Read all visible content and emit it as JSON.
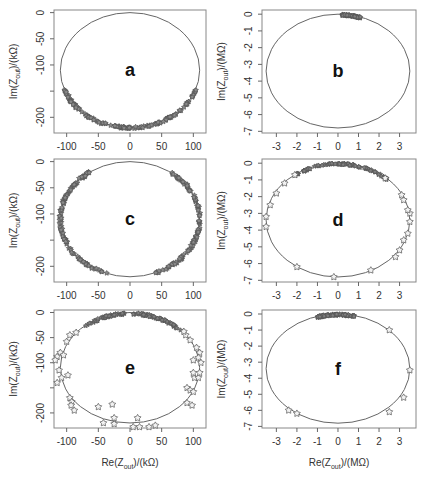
{
  "figure": {
    "caption_hint": "",
    "x_axis_label_k": "Re(Z_out)/(kΩ)",
    "x_axis_label_M": "Re(Z_out)/(MΩ)",
    "y_axis_label_k": "Im(Z_out)/(kΩ)",
    "y_axis_label_M": "Im(Z_out)/(MΩ)"
  },
  "chart_data": [
    {
      "panel": "a",
      "type": "scatter",
      "units": "kΩ",
      "xlabel": "Re(Z_out)/(kΩ)",
      "ylabel": "Im(Z_out)/(kΩ)",
      "xlim": [
        -120,
        120
      ],
      "ylim": [
        -230,
        5
      ],
      "xticks": [
        -100,
        -50,
        0,
        50,
        100
      ],
      "yticks": [
        0,
        -50,
        -100,
        -150,
        -200
      ],
      "yticklabels": [
        "0",
        "-50",
        "-100",
        "",
        "-200"
      ],
      "circle": {
        "cx": 0,
        "cy": -110,
        "rx": 110,
        "ry": 110
      },
      "points_arc_deg": [
        200,
        340
      ],
      "density": "dense"
    },
    {
      "panel": "b",
      "type": "scatter",
      "units": "MΩ",
      "xlabel": "Re(Z_out)/(MΩ)",
      "ylabel": "Im(Z_out)/(MΩ)",
      "xlim": [
        -3.7,
        3.8
      ],
      "ylim": [
        -7.1,
        0.25
      ],
      "xticks": [
        -3,
        -2,
        -1,
        0,
        1,
        2,
        3
      ],
      "yticks": [
        0,
        -1,
        -2,
        -3,
        -4,
        -5,
        -6,
        -7
      ],
      "circle": {
        "cx": 0,
        "cy": -3.4,
        "rx": 3.5,
        "ry": 3.4
      },
      "points_x_range": [
        0.2,
        1.1
      ],
      "density": "dense"
    },
    {
      "panel": "c",
      "type": "scatter",
      "units": "kΩ",
      "xlabel": "Re(Z_out)/(kΩ)",
      "ylabel": "Im(Z_out)/(kΩ)",
      "xlim": [
        -120,
        120
      ],
      "ylim": [
        -230,
        5
      ],
      "xticks": [
        -100,
        -50,
        0,
        50,
        100
      ],
      "yticks": [
        0,
        -50,
        -100,
        -150,
        -200
      ],
      "yticklabels": [
        "0",
        "-50",
        "-100",
        "",
        "-200"
      ],
      "circle": {
        "cx": 0,
        "cy": -110,
        "rx": 110,
        "ry": 110
      },
      "points_arc_deg": [
        125,
        415
      ],
      "density": "dense"
    },
    {
      "panel": "d",
      "type": "scatter",
      "units": "MΩ",
      "xlabel": "Re(Z_out)/(MΩ)",
      "ylabel": "Im(Z_out)/(MΩ)",
      "xlim": [
        -3.7,
        3.8
      ],
      "ylim": [
        -7.1,
        0.25
      ],
      "xticks": [
        -3,
        -2,
        -1,
        0,
        1,
        2,
        3
      ],
      "yticks": [
        0,
        -1,
        -2,
        -3,
        -4,
        -5,
        -6,
        -7
      ],
      "circle": {
        "cx": 0,
        "cy": -3.4,
        "rx": 3.5,
        "ry": 3.4
      },
      "sparse_points": [
        [
          -2.1,
          -0.7
        ],
        [
          -2.6,
          -1.2
        ],
        [
          -3.0,
          -1.8
        ],
        [
          -3.3,
          -2.5
        ],
        [
          -3.5,
          -3.2
        ],
        [
          -3.5,
          -3.8
        ],
        [
          -2.0,
          -6.2
        ],
        [
          -0.2,
          -6.8
        ],
        [
          1.6,
          -6.4
        ],
        [
          2.8,
          -5.6
        ],
        [
          3.0,
          -5.2
        ],
        [
          3.2,
          -4.6
        ],
        [
          3.4,
          -4.2
        ],
        [
          3.5,
          -3.5
        ],
        [
          3.5,
          -3.0
        ],
        [
          3.4,
          -2.8
        ],
        [
          3.2,
          -2.2
        ],
        [
          3.1,
          -1.9
        ],
        [
          2.3,
          -0.9
        ]
      ],
      "dense_x_range": [
        -2.2,
        2.4
      ]
    },
    {
      "panel": "e",
      "type": "scatter",
      "units": "kΩ",
      "xlabel": "Re(Z_out)/(kΩ)",
      "ylabel": "Im(Z_out)/(kΩ)",
      "xlim": [
        -120,
        120
      ],
      "ylim": [
        -230,
        5
      ],
      "xticks": [
        -100,
        -50,
        0,
        50,
        100
      ],
      "yticks": [
        0,
        -50,
        -100,
        -150,
        -200
      ],
      "yticklabels": [
        "0",
        "-50",
        "-100",
        "",
        "-200"
      ],
      "circle": {
        "cx": 0,
        "cy": -110,
        "rx": 110,
        "ry": 110
      },
      "sparse_points": [
        [
          -95,
          -45
        ],
        [
          -100,
          -58
        ],
        [
          -85,
          -40
        ],
        [
          -110,
          -80
        ],
        [
          -115,
          -88
        ],
        [
          -105,
          -85
        ],
        [
          -118,
          -95
        ],
        [
          -112,
          -115
        ],
        [
          -108,
          -130
        ],
        [
          -115,
          -140
        ],
        [
          -98,
          -125
        ],
        [
          -95,
          -170
        ],
        [
          -92,
          -178
        ],
        [
          -93,
          -185
        ],
        [
          -88,
          -195
        ],
        [
          -50,
          -188
        ],
        [
          -28,
          -183
        ],
        [
          -25,
          -210
        ],
        [
          -42,
          -220
        ],
        [
          -25,
          -222
        ],
        [
          5,
          -228
        ],
        [
          12,
          -210
        ],
        [
          15,
          -228
        ],
        [
          30,
          -228
        ],
        [
          40,
          -225
        ],
        [
          90,
          -180
        ],
        [
          98,
          -185
        ],
        [
          90,
          -150
        ],
        [
          95,
          -155
        ],
        [
          100,
          -158
        ],
        [
          102,
          -130
        ],
        [
          108,
          -130
        ],
        [
          100,
          -120
        ],
        [
          110,
          -120
        ],
        [
          105,
          -70
        ],
        [
          110,
          -80
        ],
        [
          100,
          -95
        ],
        [
          108,
          -90
        ],
        [
          112,
          -100
        ],
        [
          95,
          -55
        ],
        [
          88,
          -45
        ],
        [
          85,
          -38
        ]
      ],
      "dense_arc": "upper, x from -70 to 80"
    },
    {
      "panel": "f",
      "type": "scatter",
      "units": "MΩ",
      "xlabel": "Re(Z_out)/(MΩ)",
      "ylabel": "Im(Z_out)/(MΩ)",
      "xlim": [
        -3.7,
        3.8
      ],
      "ylim": [
        -7.1,
        0.25
      ],
      "xticks": [
        -3,
        -2,
        -1,
        0,
        1,
        2,
        3
      ],
      "yticks": [
        0,
        -1,
        -2,
        -3,
        -4,
        -5,
        -6,
        -7
      ],
      "circle": {
        "cx": 0,
        "cy": -3.4,
        "rx": 3.5,
        "ry": 3.4
      },
      "sparse_points": [
        [
          2.5,
          -1.0
        ],
        [
          3.5,
          -3.5
        ],
        [
          3.2,
          -5.2
        ],
        [
          2.5,
          -6.1
        ],
        [
          -2.4,
          -6.0
        ],
        [
          -2.0,
          -6.2
        ]
      ],
      "dense_x_range": [
        -1.0,
        0.8
      ]
    }
  ]
}
